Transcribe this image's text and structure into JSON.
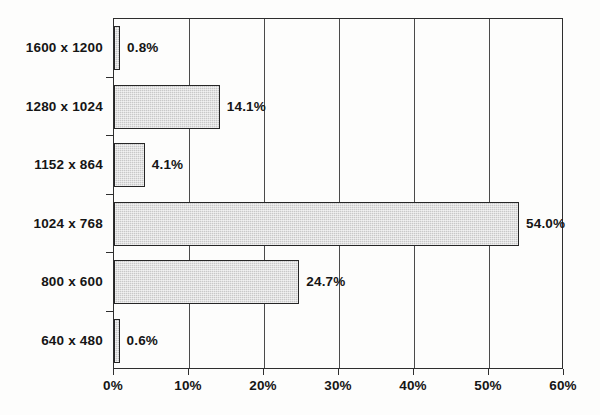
{
  "chart_data": {
    "type": "bar",
    "orientation": "horizontal",
    "title": "",
    "subtitle": "",
    "xlabel": "",
    "ylabel": "",
    "grid": true,
    "legend": false,
    "xlim": [
      0,
      60
    ],
    "xtick_step": 10,
    "categories": [
      "640 x 480",
      "800 x 600",
      "1024 x 768",
      "1152 x 864",
      "1280 x 1024",
      "1600 x 1200"
    ],
    "values": [
      0.6,
      24.7,
      54.0,
      4.1,
      14.1,
      0.8
    ],
    "data_labels": [
      "0.6%",
      "24.7%",
      "54.0%",
      "4.1%",
      "14.1%",
      "0.8%"
    ],
    "xtick_labels": [
      "0%",
      "10%",
      "20%",
      "30%",
      "40%",
      "50%",
      "60%"
    ],
    "xtick_values": [
      0,
      10,
      20,
      30,
      40,
      50,
      60
    ],
    "bars_top_to_bottom": [
      {
        "category": "1600 x 1200",
        "value": 0.8,
        "label": "0.8%"
      },
      {
        "category": "1280 x 1024",
        "value": 14.1,
        "label": "14.1%"
      },
      {
        "category": "1152 x 864",
        "value": 4.1,
        "label": "4.1%"
      },
      {
        "category": "1024 x 768",
        "value": 54.0,
        "label": "54.0%"
      },
      {
        "category": "800 x 600",
        "value": 24.7,
        "label": "24.7%"
      },
      {
        "category": "640 x 480",
        "value": 0.6,
        "label": "0.6%"
      }
    ],
    "colors": {
      "bar_fill": "#c8c8c8",
      "bar_border": "#262626",
      "axis": "#2e2e2e",
      "gridline": "#4a4a4a",
      "text": "#151515",
      "background": "#fdfdfc"
    }
  }
}
